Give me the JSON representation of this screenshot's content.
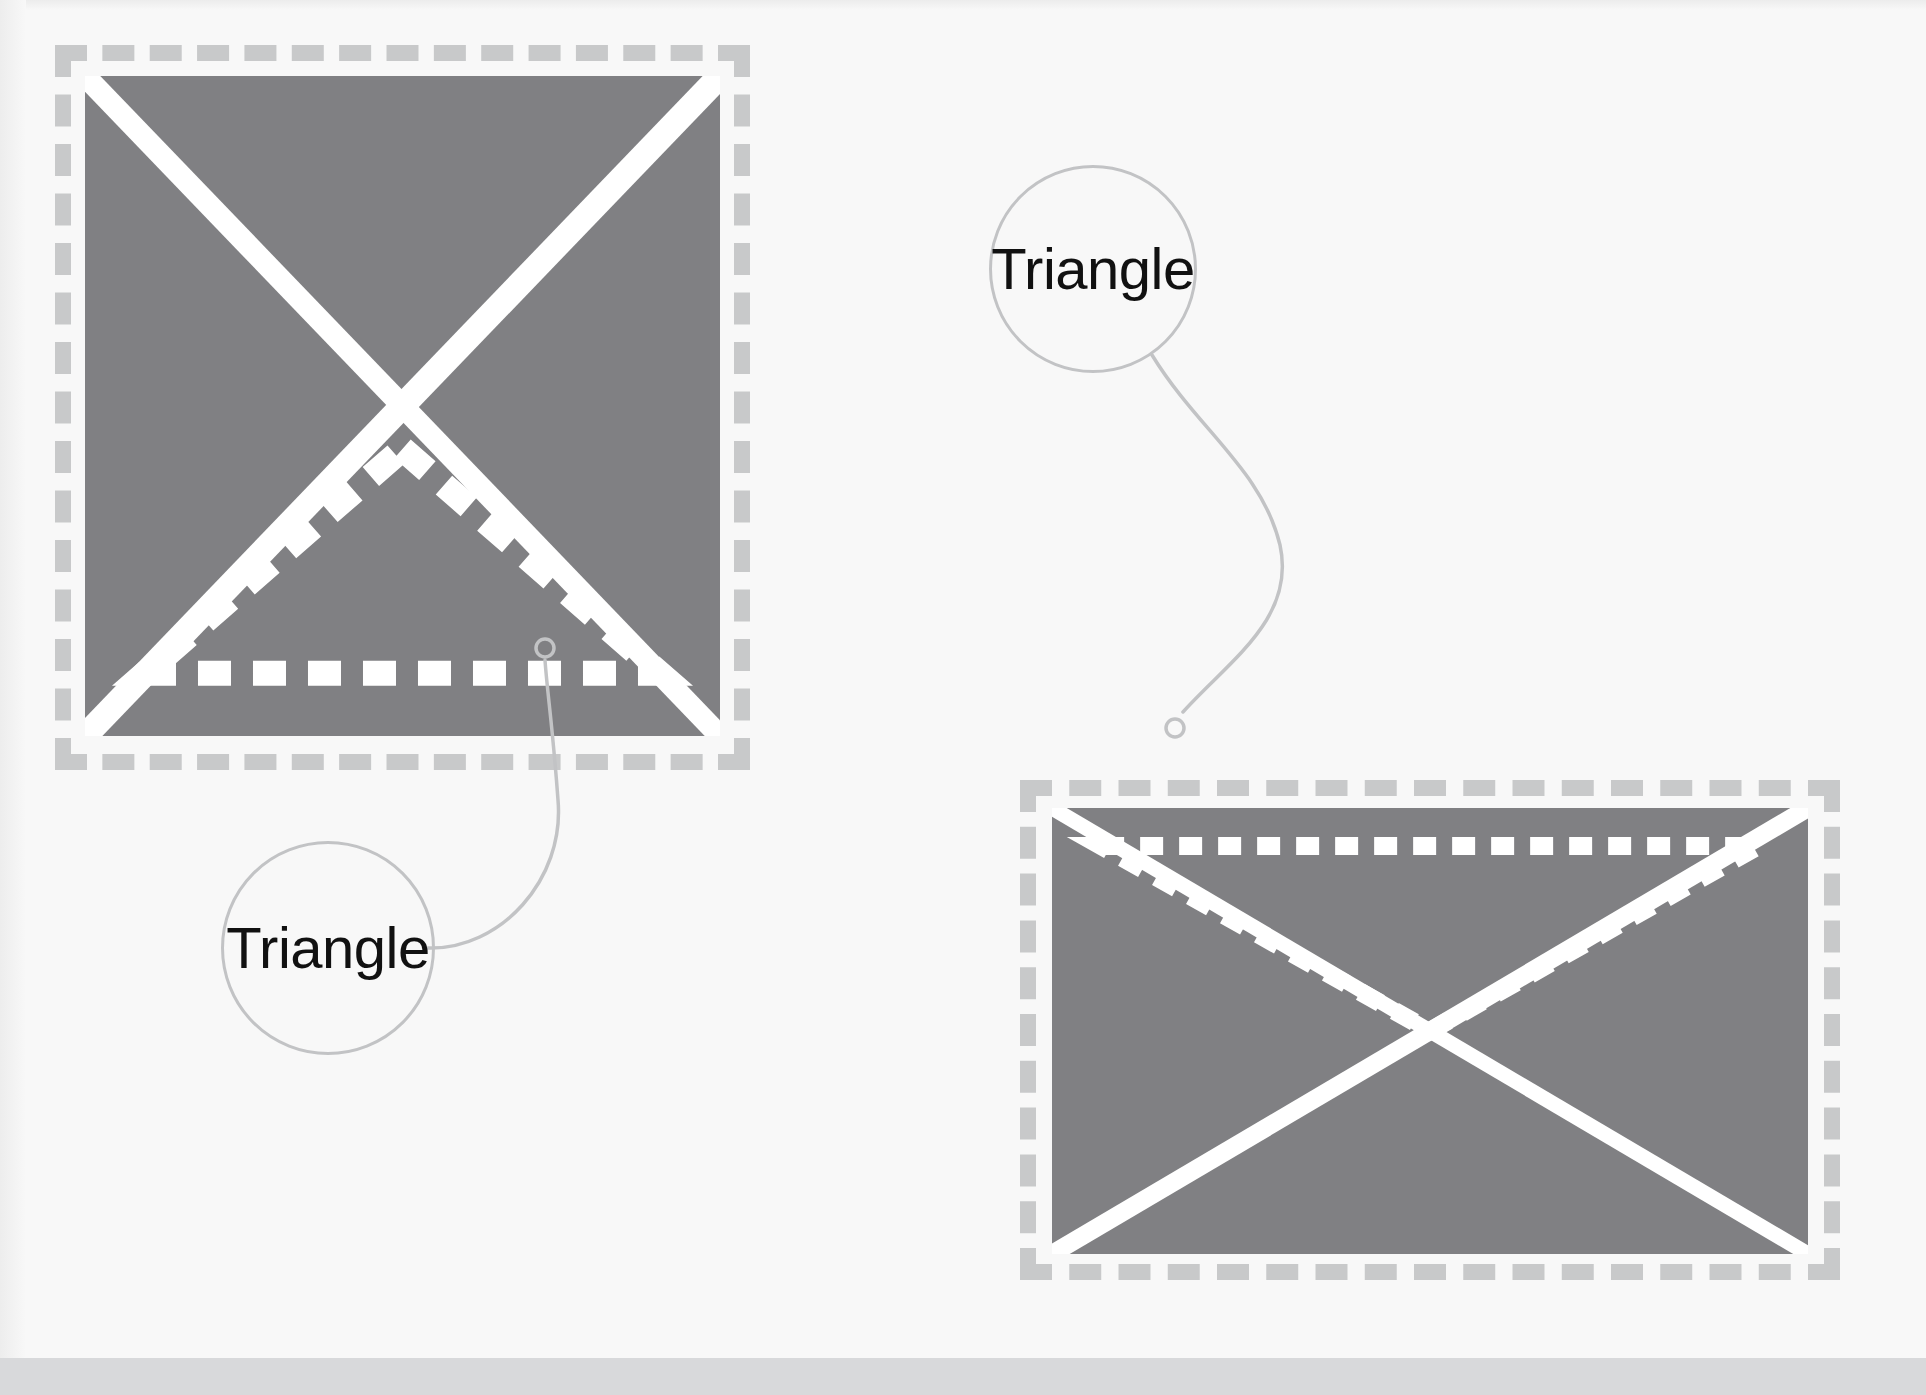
{
  "canvas": {
    "width": 1926,
    "height": 1395,
    "background_color": "#f8f8f8",
    "bottom_strip_color": "#d8d9db"
  },
  "palette": {
    "panel_fill": "#808083",
    "panel_dash_border": "#c8c9ca",
    "mark_white": "#ffffff",
    "callout_stroke": "#c2c3c5",
    "callout_text": "#111111"
  },
  "panels": [
    {
      "id": "left-panel",
      "name": "square-marking-panel",
      "shape_kind": "square",
      "border_style": "dashed",
      "border_x": 55,
      "border_y": 45,
      "border_w": 695,
      "border_h": 725,
      "fill_x": 85,
      "fill_y": 76,
      "fill_w": 635,
      "fill_h": 660,
      "overlays": [
        {
          "name": "diagonal-cross",
          "style": "solid",
          "description": "two solid white diagonals forming an X corner to corner"
        },
        {
          "name": "dashed-triangle",
          "style": "dashed",
          "orientation": "apex-up",
          "description": "white dashed triangle, apex at the X crossing, base along the bottom edge"
        }
      ],
      "anchor_point": {
        "x": 545,
        "y": 648
      }
    },
    {
      "id": "right-panel",
      "name": "rectangle-marking-panel",
      "shape_kind": "rectangle",
      "border_style": "dashed",
      "border_x": 1020,
      "border_y": 780,
      "border_w": 820,
      "border_h": 500,
      "fill_x": 1052,
      "fill_y": 808,
      "fill_w": 756,
      "fill_h": 446,
      "overlays": [
        {
          "name": "diagonal-cross",
          "style": "solid",
          "description": "two solid white diagonals forming an X corner to corner"
        },
        {
          "name": "dashed-triangle",
          "style": "dashed",
          "orientation": "apex-down",
          "description": "white dashed inverted triangle, base along the top edge, apex at the X crossing"
        }
      ],
      "anchor_point": {
        "x": 1175,
        "y": 728
      }
    }
  ],
  "callouts": [
    {
      "id": "callout-left",
      "name": "triangle-callout-left",
      "label": "Triangle",
      "circle_cx": 325,
      "circle_cy": 945,
      "circle_r": 104,
      "anchor_x": 545,
      "anchor_y": 648,
      "anchor_dot_r": 9,
      "leader_path": "M 428 948 C 500 950 565 880 558 800 C 553 730 547 690 545 660"
    },
    {
      "id": "callout-right",
      "name": "triangle-callout-right",
      "label": "Triangle",
      "circle_cx": 1090,
      "circle_cy": 266,
      "circle_r": 101,
      "anchor_x": 1175,
      "anchor_y": 728,
      "anchor_dot_r": 9,
      "leader_path": "M 1152 355 C 1198 430 1262 470 1280 545 C 1296 618 1230 660 1183 712"
    }
  ]
}
